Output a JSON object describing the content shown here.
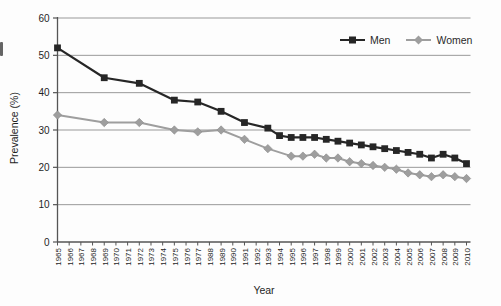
{
  "figure": {
    "kind": "line-chart-figure"
  },
  "axes": {
    "x_title": "Year",
    "y_title": "Prevalence (%)"
  },
  "style": {
    "gridline_color": "#999999",
    "axis_color": "#555555",
    "tick_label_color": "#1f1f1f",
    "background": "#fdfdfd"
  },
  "chart_data": {
    "type": "line",
    "title": "",
    "xlabel": "Year",
    "ylabel": "Prevalence (%)",
    "ylim": [
      0,
      60
    ],
    "yticks": [
      0,
      10,
      20,
      30,
      40,
      50,
      60
    ],
    "grid": "horizontal",
    "legend_position": "top-right-inside",
    "categories": [
      "1965",
      "1966",
      "1967",
      "1968",
      "1969",
      "1970",
      "1971",
      "1972",
      "1973",
      "1974",
      "1975",
      "1976",
      "1977",
      "1988",
      "1989",
      "1990",
      "1991",
      "1992",
      "1993",
      "1994",
      "1995",
      "1996",
      "1997",
      "1998",
      "1999",
      "2000",
      "2001",
      "2002",
      "2003",
      "2004",
      "2005",
      "2006",
      "2007",
      "2008",
      "2009",
      "2010"
    ],
    "series": [
      {
        "name": "Men",
        "color": "#262626",
        "marker": "square",
        "values": [
          52,
          null,
          null,
          null,
          44,
          null,
          null,
          42.5,
          null,
          null,
          38,
          null,
          37.5,
          null,
          35,
          null,
          32,
          null,
          30.5,
          28.5,
          28,
          28,
          28,
          27.5,
          27,
          26.5,
          26,
          25.5,
          25,
          24.5,
          24,
          23.5,
          22.5,
          23.5,
          22.5,
          21
        ]
      },
      {
        "name": "Women",
        "color": "#9e9e9e",
        "marker": "diamond",
        "values": [
          34,
          null,
          null,
          null,
          32,
          null,
          null,
          32,
          null,
          null,
          30,
          null,
          29.5,
          null,
          30,
          null,
          27.5,
          null,
          25,
          null,
          23,
          23,
          23.5,
          22.5,
          22.5,
          21.5,
          21,
          20.5,
          20,
          19.5,
          18.5,
          18,
          17.5,
          18,
          17.5,
          17
        ]
      }
    ]
  }
}
